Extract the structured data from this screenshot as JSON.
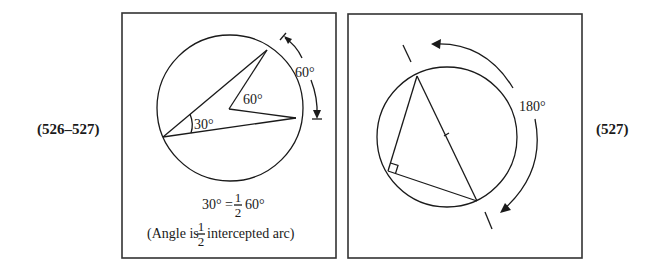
{
  "figures": [
    {
      "ref_label": "(526–527)",
      "central_angle_label": "60°",
      "inscribed_angle_label": "30°",
      "arc_label": "60°",
      "formula": {
        "lhs": "30°",
        "equals": "=",
        "numerator": "1",
        "denominator": "2",
        "rhs": "60°"
      },
      "caption": {
        "prefix": "(Angle is",
        "numerator": "1",
        "denominator": "2",
        "suffix": "intercepted arc)"
      }
    },
    {
      "ref_label": "(527)",
      "arc_label": "180°"
    }
  ]
}
